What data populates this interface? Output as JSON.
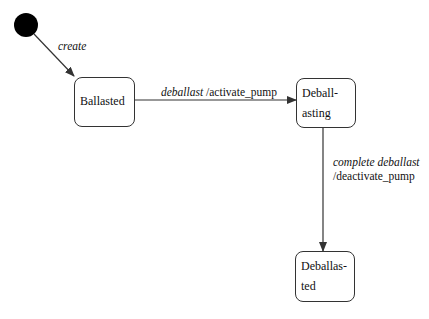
{
  "diagram": {
    "type": "state-machine",
    "initial_state": {
      "shape": "filled-circle",
      "color": "#000000"
    },
    "states": [
      {
        "id": "ballasted",
        "lines": [
          "Ballasted"
        ]
      },
      {
        "id": "deballasting",
        "lines": [
          "Deball-",
          "asting"
        ]
      },
      {
        "id": "deballasted",
        "lines": [
          "Deballas-",
          "ted"
        ]
      }
    ],
    "transitions": [
      {
        "from": "initial",
        "to": "ballasted",
        "event": "create",
        "action": ""
      },
      {
        "from": "ballasted",
        "to": "deballasting",
        "event": "deballast",
        "action": "/activate_pump"
      },
      {
        "from": "deballasting",
        "to": "deballasted",
        "event": "complete deballast",
        "action": "/deactivate_pump"
      }
    ]
  }
}
